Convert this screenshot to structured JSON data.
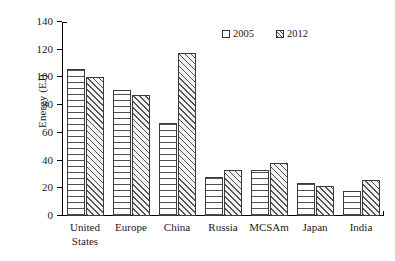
{
  "chart_data": {
    "type": "bar",
    "title": "",
    "xlabel": "",
    "ylabel": "Energy (EJ)",
    "ylim": [
      0,
      140
    ],
    "yticks": [
      0,
      20,
      40,
      60,
      80,
      100,
      120,
      140
    ],
    "grid": false,
    "legend_position": "top-right",
    "categories": [
      "United States",
      "Europe",
      "China",
      "Russia",
      "MCSAm",
      "Japan",
      "India"
    ],
    "category_lines": [
      [
        "United",
        "States"
      ],
      [
        "Europe"
      ],
      [
        "China"
      ],
      [
        "Russia"
      ],
      [
        "MCSAm"
      ],
      [
        "Japan"
      ],
      [
        "India"
      ]
    ],
    "series": [
      {
        "name": "2005",
        "values": [
          106,
          91,
          67,
          28,
          33,
          24,
          18
        ]
      },
      {
        "name": "2012",
        "values": [
          100,
          87,
          118,
          33,
          38,
          22,
          26
        ]
      }
    ]
  }
}
